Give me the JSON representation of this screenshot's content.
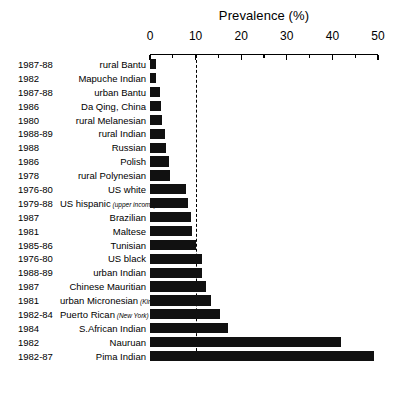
{
  "chart_data": {
    "type": "bar",
    "orientation": "horizontal",
    "title": "Prevalence (%)",
    "xlabel": "Prevalence (%)",
    "ylabel": "",
    "xlim": [
      0,
      50
    ],
    "xticks": [
      0,
      10,
      20,
      30,
      40,
      50
    ],
    "xtick_labels": [
      "0",
      "10",
      "20",
      "30",
      "40",
      "50"
    ],
    "minor_tick_step": 5,
    "grid": false,
    "legend": null,
    "annotations": [
      {
        "name": "threshold-10-percent",
        "type": "vertical-dashed-line",
        "value": 10
      }
    ],
    "categories": [
      "rural Bantu",
      "Mapuche Indian",
      "urban Bantu",
      "Da Qing, China",
      "rural Melanesian",
      "rural Indian",
      "Russian",
      "Polish",
      "rural Polynesian",
      "US white",
      "US hispanic (upper income)",
      "Brazilian",
      "Maltese",
      "Tunisian",
      "US black",
      "urban Indian",
      "Chinese Mauritian",
      "urban Micronesian (Kiribati)",
      "Puerto Rican (New York)",
      "S.African Indian",
      "Nauruan",
      "Pima Indian"
    ],
    "values": [
      1.3,
      1.3,
      2.1,
      2.4,
      2.6,
      3.2,
      3.4,
      4.2,
      4.4,
      7.9,
      8.3,
      9.0,
      9.2,
      10.0,
      11.3,
      11.5,
      12.3,
      13.4,
      15.4,
      17.1,
      41.9,
      49.1
    ],
    "rows": [
      {
        "year": "1987-88",
        "group": "rural Bantu",
        "note": "",
        "value": 1.3
      },
      {
        "year": "1982",
        "group": "Mapuche Indian",
        "note": "",
        "value": 1.3
      },
      {
        "year": "1987-88",
        "group": "urban Bantu",
        "note": "",
        "value": 2.1
      },
      {
        "year": "1986",
        "group": "Da Qing, China",
        "note": "",
        "value": 2.4
      },
      {
        "year": "1980",
        "group": "rural Melanesian",
        "note": "",
        "value": 2.6
      },
      {
        "year": "1988-89",
        "group": "rural Indian",
        "note": "",
        "value": 3.2
      },
      {
        "year": "1988",
        "group": "Russian",
        "note": "",
        "value": 3.4
      },
      {
        "year": "1986",
        "group": "Polish",
        "note": "",
        "value": 4.2
      },
      {
        "year": "1978",
        "group": "rural Polynesian",
        "note": "",
        "value": 4.4
      },
      {
        "year": "1976-80",
        "group": "US white",
        "note": "",
        "value": 7.9
      },
      {
        "year": "1979-88",
        "group": "US hispanic",
        "note": "(upper income)",
        "value": 8.3
      },
      {
        "year": "1987",
        "group": "Brazilian",
        "note": "",
        "value": 9.0
      },
      {
        "year": "1981",
        "group": "Maltese",
        "note": "",
        "value": 9.2
      },
      {
        "year": "1985-86",
        "group": "Tunisian",
        "note": "",
        "value": 10.0
      },
      {
        "year": "1976-80",
        "group": "US black",
        "note": "",
        "value": 11.3
      },
      {
        "year": "1988-89",
        "group": "urban Indian",
        "note": "",
        "value": 11.5
      },
      {
        "year": "1987",
        "group": "Chinese Mauritian",
        "note": "",
        "value": 12.3
      },
      {
        "year": "1981",
        "group": "urban Micronesian",
        "note": "(Kiribati)",
        "value": 13.4
      },
      {
        "year": "1982-84",
        "group": "Puerto Rican",
        "note": "(New York)",
        "value": 15.4
      },
      {
        "year": "1984",
        "group": "S.African Indian",
        "note": "",
        "value": 17.1
      },
      {
        "year": "1982",
        "group": "Nauruan",
        "note": "",
        "value": 41.9
      },
      {
        "year": "1982-87",
        "group": "Pima Indian",
        "note": "",
        "value": 49.1
      }
    ],
    "colors": {
      "bar": "#111111",
      "axis": "#000000",
      "text": "#000000",
      "background": "#ffffff",
      "threshold": "#000000"
    }
  }
}
